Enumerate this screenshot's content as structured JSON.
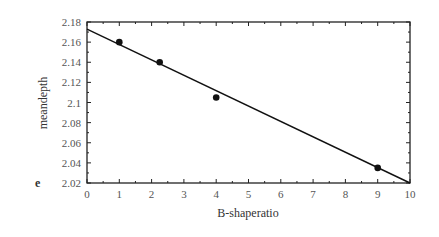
{
  "panel_label": "e",
  "chart_data": {
    "type": "scatter",
    "title": "",
    "xlabel": "B-shaperatio",
    "ylabel": "meandepth",
    "xlim": [
      0,
      10
    ],
    "ylim": [
      2.02,
      2.18
    ],
    "xticks": [
      0,
      1,
      2,
      3,
      4,
      5,
      6,
      7,
      8,
      9,
      10
    ],
    "yticks": [
      2.02,
      2.04,
      2.06,
      2.08,
      2.1,
      2.12,
      2.14,
      2.16,
      2.18
    ],
    "ytick_labels": [
      "2.02",
      "2.04",
      "2.06",
      "2.08",
      "2.1",
      "2.12",
      "2.14",
      "2.16",
      "2.18"
    ],
    "grid": false,
    "legend": null,
    "points": [
      {
        "x": 1,
        "y": 2.16
      },
      {
        "x": 2.25,
        "y": 2.14
      },
      {
        "x": 4,
        "y": 2.105
      },
      {
        "x": 9,
        "y": 2.035
      }
    ],
    "fit_line": {
      "x": [
        0,
        10
      ],
      "y": [
        2.173,
        2.02
      ]
    },
    "colors": {
      "points": "#111111",
      "line": "#111111",
      "axis": "#222222"
    }
  }
}
